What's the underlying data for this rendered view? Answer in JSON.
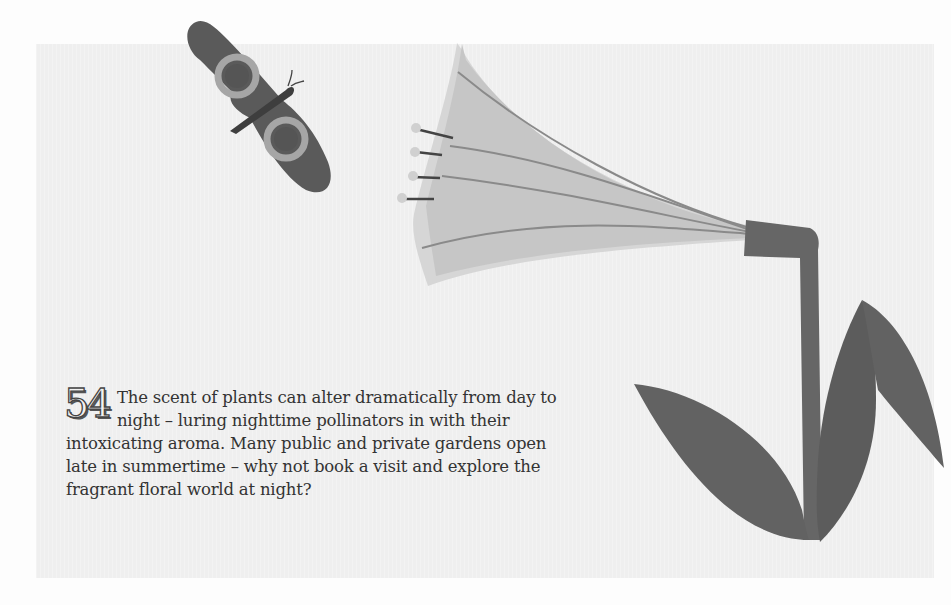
{
  "fact": {
    "number": "54",
    "text": "The scent of plants can alter dramatically from day to night – luring nighttime pollinators in with their intoxicating aroma. Many public and private gardens open late in summertime – why not book a visit and explore the fragrant floral world at night?"
  },
  "illustration": {
    "subjects": [
      "moth-icon",
      "lily-flower-icon",
      "stem-and-leaves-icon"
    ],
    "colors": {
      "background": "#efefef",
      "moth_wing": "#5a5a5a",
      "moth_ring": "#a6a6a6",
      "moth_body": "#3e3e3e",
      "flower_petal": "#cdcdcd",
      "flower_vein": "#8a8a8a",
      "stem_leaves": "#666666"
    }
  }
}
